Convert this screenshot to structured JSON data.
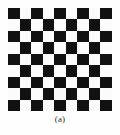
{
  "figure": {
    "caption": "(a)",
    "background_color": "#fefefe"
  },
  "checkerboard": {
    "alt_text": "checkerboard calibration pattern",
    "rows": 9,
    "columns": 9,
    "top_left_square": "dark",
    "dark_color": "#111111",
    "light_color": "#fbfbfb",
    "pattern": [
      [
        "dark",
        "light",
        "dark",
        "light",
        "dark",
        "light",
        "dark",
        "light",
        "dark"
      ],
      [
        "light",
        "dark",
        "light",
        "dark",
        "light",
        "dark",
        "light",
        "dark",
        "light"
      ],
      [
        "dark",
        "light",
        "dark",
        "light",
        "dark",
        "light",
        "dark",
        "light",
        "dark"
      ],
      [
        "light",
        "dark",
        "light",
        "dark",
        "light",
        "dark",
        "light",
        "dark",
        "light"
      ],
      [
        "dark",
        "light",
        "dark",
        "light",
        "dark",
        "light",
        "dark",
        "light",
        "dark"
      ],
      [
        "light",
        "dark",
        "light",
        "dark",
        "light",
        "dark",
        "light",
        "dark",
        "light"
      ],
      [
        "dark",
        "light",
        "dark",
        "light",
        "dark",
        "light",
        "dark",
        "light",
        "dark"
      ],
      [
        "light",
        "dark",
        "light",
        "dark",
        "light",
        "dark",
        "light",
        "dark",
        "light"
      ],
      [
        "dark",
        "light",
        "dark",
        "light",
        "dark",
        "light",
        "dark",
        "light",
        "dark"
      ]
    ]
  }
}
